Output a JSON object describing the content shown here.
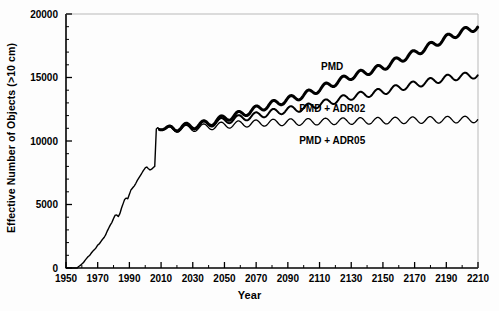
{
  "chart_data": {
    "type": "line",
    "title": "",
    "xlabel": "Year",
    "ylabel": "Effective Number of Objects (>10 cm)",
    "xlim": [
      1950,
      2210
    ],
    "ylim": [
      0,
      20000
    ],
    "x_major_ticks": [
      1950,
      1970,
      1990,
      2010,
      2030,
      2050,
      2070,
      2090,
      2110,
      2130,
      2150,
      2170,
      2190,
      2210
    ],
    "x_tick_labels": [
      "1950",
      "1970",
      "1990",
      "2010",
      "2030",
      "2050",
      "2070",
      "2090",
      "2110",
      "2130",
      "2150",
      "2170",
      "2190",
      "2210"
    ],
    "x_minor_interval": 10,
    "y_major_ticks": [
      0,
      5000,
      10000,
      15000,
      20000
    ],
    "y_tick_labels": [
      "0",
      "5000",
      "10000",
      "15000",
      "20000"
    ],
    "y_minor_interval": 1000,
    "grid": false,
    "legend_position": "inline-annotations",
    "historical": {
      "name": "Historical (shared)",
      "x": [
        1950,
        1957,
        1958,
        1959,
        1960,
        1961,
        1962,
        1963,
        1964,
        1965,
        1966,
        1967,
        1968,
        1969,
        1970,
        1971,
        1972,
        1973,
        1974,
        1975,
        1976,
        1977,
        1978,
        1979,
        1980,
        1981,
        1982,
        1983,
        1984,
        1985,
        1986,
        1987,
        1988,
        1989,
        1990,
        1991,
        1992,
        1993,
        1994,
        1995,
        1996,
        1997,
        1998,
        1999,
        2000,
        2001,
        2002,
        2003,
        2004,
        2005,
        2006,
        2007,
        2008,
        2009
      ],
      "y": [
        0,
        0,
        120,
        200,
        320,
        420,
        600,
        760,
        900,
        1000,
        1180,
        1330,
        1450,
        1600,
        1800,
        1900,
        2080,
        2250,
        2400,
        2600,
        2900,
        3150,
        3400,
        3600,
        3900,
        4150,
        4180,
        4050,
        4280,
        4700,
        5050,
        5400,
        5500,
        5450,
        5800,
        6150,
        6300,
        6450,
        6650,
        6900,
        7100,
        7300,
        7500,
        7700,
        7880,
        7950,
        7820,
        7720,
        7780,
        7900,
        8000,
        10950,
        11050,
        10900
      ]
    },
    "series": [
      {
        "name": "PMD",
        "label": "PMD",
        "line_weight": "thick",
        "value_2010": 10950,
        "value_2050": 11800,
        "value_2100": 13600,
        "value_2150": 15800,
        "value_2210": 19000,
        "x": [
          2009,
          2020,
          2030,
          2040,
          2050,
          2060,
          2070,
          2080,
          2090,
          2100,
          2110,
          2120,
          2130,
          2140,
          2150,
          2160,
          2170,
          2180,
          2190,
          2200,
          2210
        ],
        "y": [
          10900,
          11050,
          11200,
          11400,
          11800,
          12100,
          12500,
          12900,
          13250,
          13600,
          14100,
          14600,
          15100,
          15450,
          15800,
          16400,
          16900,
          17500,
          18100,
          18600,
          19000
        ]
      },
      {
        "name": "PMD + ADR02",
        "label": "PMD + ADR02",
        "line_weight": "medium",
        "value_2010": 10950,
        "value_2050": 11600,
        "value_2100": 12600,
        "value_2150": 13900,
        "value_2210": 15200,
        "x": [
          2009,
          2020,
          2030,
          2040,
          2050,
          2060,
          2070,
          2080,
          2090,
          2100,
          2110,
          2120,
          2130,
          2140,
          2150,
          2160,
          2170,
          2180,
          2190,
          2200,
          2210
        ],
        "y": [
          10900,
          11020,
          11150,
          11350,
          11600,
          11800,
          12000,
          12250,
          12450,
          12600,
          12900,
          13200,
          13500,
          13700,
          13900,
          14200,
          14450,
          14700,
          14950,
          15100,
          15200
        ]
      },
      {
        "name": "PMD + ADR05",
        "label": "PMD + ADR05",
        "line_weight": "thin",
        "value_2010": 10950,
        "value_2050": 11250,
        "value_2100": 11500,
        "value_2150": 11600,
        "value_2210": 11700,
        "x": [
          2009,
          2020,
          2030,
          2040,
          2050,
          2060,
          2070,
          2080,
          2090,
          2100,
          2110,
          2120,
          2130,
          2140,
          2150,
          2160,
          2170,
          2180,
          2190,
          2200,
          2210
        ],
        "y": [
          10900,
          10950,
          11000,
          11120,
          11250,
          11330,
          11400,
          11450,
          11480,
          11500,
          11530,
          11550,
          11570,
          11585,
          11600,
          11620,
          11640,
          11660,
          11680,
          11690,
          11700
        ]
      }
    ],
    "annotations": [
      {
        "text": "PMD",
        "x_year": 2118,
        "y_value": 15850
      },
      {
        "text": "PMD + ADR02",
        "x_year": 2118,
        "y_value": 12500
      },
      {
        "text": "PMD + ADR05",
        "x_year": 2118,
        "y_value": 10000
      }
    ],
    "oscillation": {
      "description": "11-year solar cycle ripple superimposed on projections",
      "period_years": 11,
      "amplitude": 260
    },
    "colors": {
      "line": "#000000",
      "axis": "#000000",
      "background": "#ffffff"
    }
  }
}
